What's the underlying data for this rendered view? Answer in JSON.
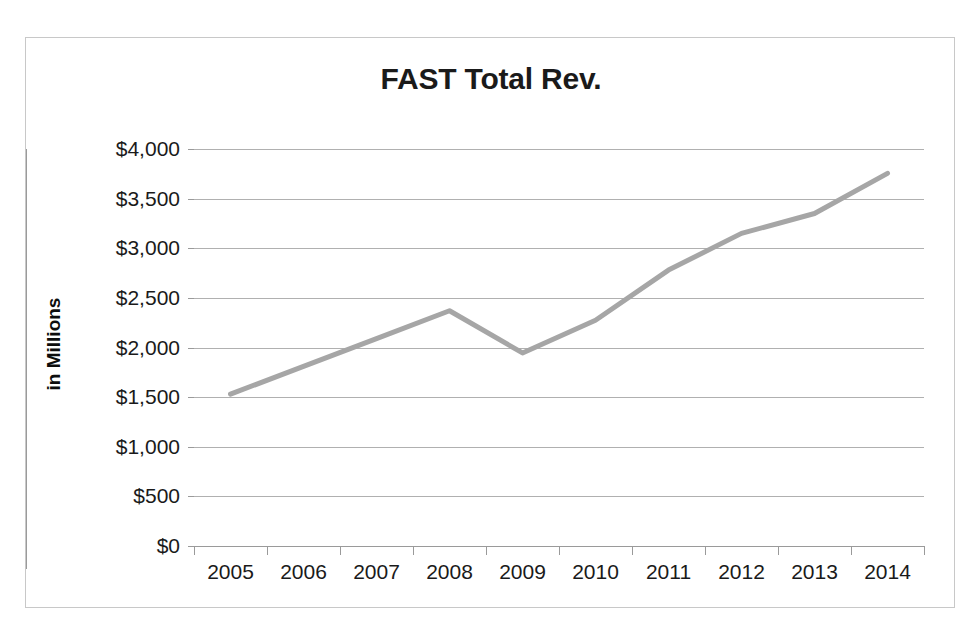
{
  "page": {
    "clipped_top_text": "",
    "background_color": "#ffffff"
  },
  "chart_frame": {
    "border_color": "#c8c8c8"
  },
  "chart_data": {
    "type": "line",
    "title": "FAST Total Rev.",
    "xlabel": "",
    "ylabel": "in Millions",
    "categories": [
      "2005",
      "2006",
      "2007",
      "2008",
      "2009",
      "2010",
      "2011",
      "2012",
      "2013",
      "2014"
    ],
    "values": [
      1530,
      1810,
      2090,
      2370,
      1945,
      2275,
      2780,
      3150,
      3350,
      3755
    ],
    "series": [
      {
        "name": "FAST Total Rev.",
        "color": "#a6a6a6",
        "values": [
          1530,
          1810,
          2090,
          2370,
          1945,
          2275,
          2780,
          3150,
          3350,
          3755
        ]
      }
    ],
    "ylim": [
      0,
      4000
    ],
    "ytick_values": [
      4000,
      3500,
      3000,
      2500,
      2000,
      1500,
      1000,
      500,
      0
    ],
    "ytick_labels": [
      "$4,000",
      "$3,500",
      "$3,000",
      "$2,500",
      "$2,000",
      "$1,500",
      "$1,000",
      "$500",
      "$0"
    ],
    "grid": true,
    "gridline_color": "#b0b0b0",
    "axis_color": "#9a9a9a",
    "legend": false,
    "legend_position": "none",
    "line_width_px": 5
  }
}
